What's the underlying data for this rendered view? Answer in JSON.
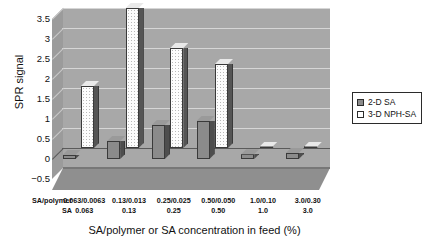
{
  "axes": {
    "ylabel": "SPR signal",
    "xlabel": "SA/polymer or SA concentration in feed (%)",
    "yticks": [
      "3.5",
      "3",
      "2.5",
      "2",
      "1.5",
      "1",
      "0.5",
      "0",
      "-0.5"
    ],
    "ymin": -0.5,
    "ymax": 3.5,
    "row_headers": [
      "SA/polymer",
      "SA"
    ]
  },
  "legend": {
    "entries": [
      {
        "label": "2-D SA",
        "color": "#8b8b8b"
      },
      {
        "label": "3-D NPH-SA",
        "color": "#ffffff"
      }
    ]
  },
  "chart_data": {
    "type": "bar",
    "title": "",
    "xlabel": "SA/polymer or SA concentration in feed (%)",
    "ylabel": "SPR signal",
    "ylim": [
      -0.5,
      3.5
    ],
    "yticks": [
      -0.5,
      0,
      0.5,
      1,
      1.5,
      2,
      2.5,
      3,
      3.5
    ],
    "grid": true,
    "legend_position": "right",
    "categories": [
      "0.063/0.0063",
      "0.13/0.013",
      "0.25/0.025",
      "0.50/0.050",
      "1.0/0.10",
      "3.0/0.30"
    ],
    "categories_row2": [
      "0.063",
      "0.13",
      "0.25",
      "0.50",
      "1.0",
      "3.0"
    ],
    "series": [
      {
        "name": "2-D SA",
        "values": [
          0.1,
          0.45,
          0.85,
          0.95,
          0.12,
          0.15
        ]
      },
      {
        "name": "3-D NPH-SA",
        "values": [
          1.55,
          3.5,
          2.5,
          2.1,
          0.02,
          0.02
        ]
      }
    ]
  }
}
